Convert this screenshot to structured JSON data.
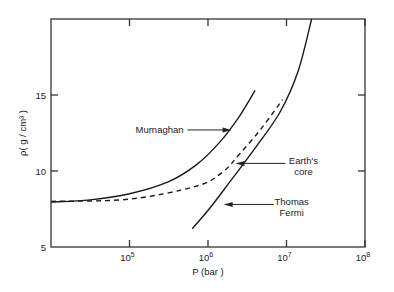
{
  "chart_data": {
    "type": "line",
    "title": "",
    "xlabel": "P (bar )",
    "ylabel": "ρ( g / cm³ )",
    "xscale": "log",
    "xlim": [
      10000,
      100000000
    ],
    "ylim": [
      5,
      20
    ],
    "x_ticks": [
      {
        "value": 100000,
        "base": "10",
        "exp": "5"
      },
      {
        "value": 1000000,
        "base": "10",
        "exp": "6"
      },
      {
        "value": 10000000,
        "base": "10",
        "exp": "7"
      },
      {
        "value": 100000000,
        "base": "10",
        "exp": "8"
      }
    ],
    "y_ticks": [
      {
        "value": 5,
        "label": "5"
      },
      {
        "value": 10,
        "label": "10"
      },
      {
        "value": 15,
        "label": "15"
      }
    ],
    "grid": false,
    "series": [
      {
        "name": "Murnaghan",
        "style": "solid",
        "log10_x": [
          4.0,
          4.5,
          5.0,
          5.5,
          5.85,
          6.15,
          6.4,
          6.6
        ],
        "y": [
          7.96,
          8.1,
          8.5,
          9.3,
          10.4,
          11.9,
          13.6,
          15.3
        ]
      },
      {
        "name": "Earth's core",
        "style": "dashed",
        "log10_x": [
          4.0,
          5.0,
          5.85,
          6.18,
          6.4,
          6.68,
          6.95
        ],
        "y": [
          8.0,
          8.15,
          9.0,
          9.9,
          11.1,
          12.8,
          14.7
        ]
      },
      {
        "name": "Thomas Fermi",
        "style": "solid",
        "log10_x": [
          5.8,
          6.03,
          6.28,
          6.6,
          6.92,
          7.15,
          7.32
        ],
        "y": [
          6.2,
          7.6,
          9.3,
          11.5,
          13.9,
          16.6,
          20.0
        ]
      }
    ],
    "annotations": [
      {
        "series": "Murnaghan",
        "lines": [
          "Murnaghan"
        ],
        "side": "left",
        "arrow_to": {
          "log10_x": 6.3,
          "y": 12.7
        }
      },
      {
        "series": "Earth's core",
        "lines": [
          "Earth's",
          "core"
        ],
        "side": "right",
        "arrow_to": {
          "log10_x": 6.35,
          "y": 10.5
        }
      },
      {
        "series": "Thomas Fermi",
        "lines": [
          "Thomas",
          "Fermi"
        ],
        "side": "right",
        "arrow_to": {
          "log10_x": 6.2,
          "y": 7.8
        }
      }
    ]
  }
}
